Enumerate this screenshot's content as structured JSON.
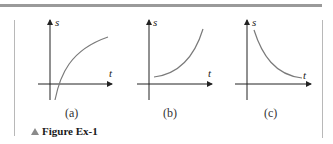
{
  "figure": {
    "caption": "Figure Ex-1",
    "caption_icon": "triangle-up-icon",
    "panels": [
      {
        "id": "a",
        "label": "(a)",
        "y_axis_label": "s",
        "x_axis_label": "t",
        "curve": "concave-down increasing, starts below t-axis, crosses t-axis and levels off"
      },
      {
        "id": "b",
        "label": "(b)",
        "y_axis_label": "s",
        "x_axis_label": "t",
        "curve": "concave-up increasing, starts above t-axis"
      },
      {
        "id": "c",
        "label": "(c)",
        "y_axis_label": "s",
        "x_axis_label": "t",
        "curve": "concave-up decreasing, approaches t-axis"
      }
    ]
  },
  "colors": {
    "axis": "#222222",
    "curve": "#7a7a7a",
    "topbar": "#9a9a9a",
    "border": "#b8b8b8"
  }
}
